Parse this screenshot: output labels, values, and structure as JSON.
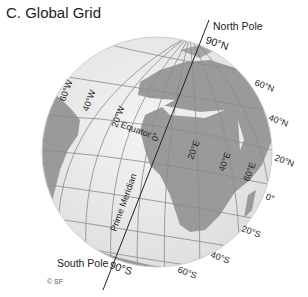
{
  "title": "C. Global Grid",
  "copyright": "© SF",
  "poles": {
    "north_label": "North Pole",
    "north_value": "90°N",
    "south_label": "South Pole",
    "south_value": "90°S"
  },
  "lines": {
    "equator": "Equator",
    "prime_meridian": "Prime Meridian"
  },
  "longitudes": [
    "60°W",
    "40°W",
    "20°W",
    "0°",
    "20°E",
    "40°E",
    "60°E"
  ],
  "latitudes": [
    "60°N",
    "40°N",
    "20°N",
    "0°",
    "20°S",
    "40°S",
    "60°S"
  ],
  "colors": {
    "ocean": "#ececec",
    "land": "#9a9a9a",
    "grid": "#8a8a8a",
    "axis": "#222222"
  }
}
